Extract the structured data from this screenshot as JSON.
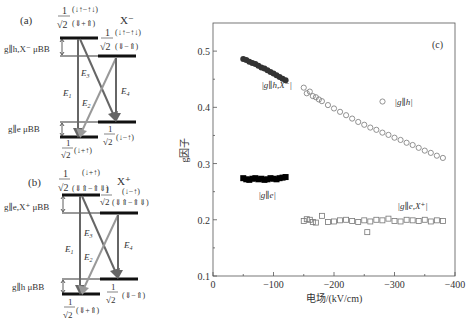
{
  "panel_a": {
    "label": "(a)",
    "species": "X⁻",
    "upper_left_state": {
      "prefix": "1/√2",
      "top": "(↓↑−↑↓)",
      "bottom": "(⇓+⇑)"
    },
    "upper_right_state": {
      "prefix": "1/√2",
      "top": "(↓↑−↑↓)",
      "bottom": "(⇓−⇑)"
    },
    "upper_splitting_label": "g∥h,X⁻ μBB",
    "lower_splitting_label": "g∥e μBB",
    "lower_left_state": "1/√2 (↓+↑)",
    "lower_right_state": "1/√2 (↓−↑)",
    "transitions": [
      "E1",
      "E2",
      "E3",
      "E4"
    ]
  },
  "panel_b": {
    "label": "(b)",
    "species": "X⁺",
    "upper_left_state": {
      "prefix": "1/√2",
      "top": "(↓+↑)",
      "bottom": "(⇓⇑−⇑⇓)"
    },
    "upper_right_state": {
      "prefix": "1/√2",
      "top": "(↓−↑)",
      "bottom": "(⇓⇑−⇑⇓)"
    },
    "upper_splitting_label": "g∥e,X⁺ μBB",
    "lower_splitting_label": "g∥h μBB",
    "lower_left_state": "1/√2 (⇓+⇑)",
    "lower_right_state": "1/√2 (⇓−⇑)",
    "transitions": [
      "E1",
      "E2",
      "E3",
      "E4"
    ]
  },
  "chart_data": {
    "type": "scatter",
    "panel_label": "(c)",
    "title": "",
    "xlabel": "电场/(kV/cm)",
    "ylabel": "g因子",
    "xlim": [
      0,
      -400
    ],
    "ylim": [
      0.1,
      0.55
    ],
    "xticks": [
      0,
      -100,
      -200,
      -300,
      -400
    ],
    "xtick_labels": [
      "0",
      "−100",
      "−200",
      "−300",
      "−400"
    ],
    "yticks": [
      0.1,
      0.2,
      0.3,
      0.4,
      0.5
    ],
    "ytick_labels": [
      "0.1",
      "0.2",
      "0.3",
      "0.4",
      "0.5"
    ],
    "grid": false,
    "series": [
      {
        "name": "|g∥h,X⁻|",
        "marker": "filled-circle",
        "color": "#333333",
        "x": [
          -50,
          -55,
          -60,
          -65,
          -70,
          -75,
          -80,
          -85,
          -90,
          -95,
          -100,
          -105,
          -110,
          -115,
          -120
        ],
        "y": [
          0.486,
          0.484,
          0.481,
          0.479,
          0.477,
          0.474,
          0.471,
          0.469,
          0.466,
          0.463,
          0.46,
          0.457,
          0.454,
          0.451,
          0.448
        ]
      },
      {
        "name": "|g∥e|",
        "marker": "filled-square",
        "color": "#000000",
        "x": [
          -50,
          -55,
          -60,
          -65,
          -70,
          -75,
          -80,
          -85,
          -90,
          -95,
          -100,
          -105,
          -110,
          -115,
          -120
        ],
        "y": [
          0.274,
          0.272,
          0.271,
          0.273,
          0.274,
          0.272,
          0.273,
          0.271,
          0.272,
          0.274,
          0.273,
          0.272,
          0.274,
          0.275,
          0.276
        ]
      },
      {
        "name": "|g∥h|",
        "marker": "open-circle",
        "color": "#777777",
        "x": [
          -150,
          -155,
          -160,
          -165,
          -170,
          -175,
          -180,
          -190,
          -200,
          -210,
          -220,
          -230,
          -240,
          -250,
          -260,
          -270,
          -280,
          -290,
          -300,
          -310,
          -320,
          -330,
          -340,
          -350,
          -360,
          -370,
          -380
        ],
        "y": [
          0.435,
          0.425,
          0.428,
          0.42,
          0.418,
          0.414,
          0.411,
          0.404,
          0.398,
          0.392,
          0.386,
          0.38,
          0.374,
          0.369,
          0.364,
          0.36,
          0.355,
          0.351,
          0.346,
          0.342,
          0.337,
          0.333,
          0.328,
          0.323,
          0.319,
          0.314,
          0.31
        ]
      },
      {
        "name": "|g∥e,X⁺|",
        "marker": "open-square",
        "color": "#777777",
        "x": [
          -150,
          -155,
          -160,
          -165,
          -170,
          -180,
          -190,
          -200,
          -210,
          -220,
          -230,
          -240,
          -250,
          -260,
          -270,
          -280,
          -290,
          -300,
          -310,
          -320,
          -330,
          -340,
          -350,
          -360,
          -370,
          -380,
          -255
        ],
        "y": [
          0.198,
          0.201,
          0.2,
          0.196,
          0.195,
          0.207,
          0.196,
          0.197,
          0.199,
          0.2,
          0.198,
          0.196,
          0.199,
          0.197,
          0.2,
          0.199,
          0.202,
          0.198,
          0.197,
          0.2,
          0.199,
          0.198,
          0.2,
          0.197,
          0.199,
          0.198,
          0.178
        ]
      }
    ],
    "annotations": [
      {
        "text": "|g∥h,X⁻|",
        "x": -80,
        "y": 0.435
      },
      {
        "text": "|g∥e|",
        "x": -75,
        "y": 0.238
      },
      {
        "text": "|g∥h|",
        "x": -300,
        "y": 0.405,
        "legend_marker": "open-circle"
      },
      {
        "text": "|g∥e,X⁺|",
        "x": -305,
        "y": 0.22
      }
    ]
  }
}
